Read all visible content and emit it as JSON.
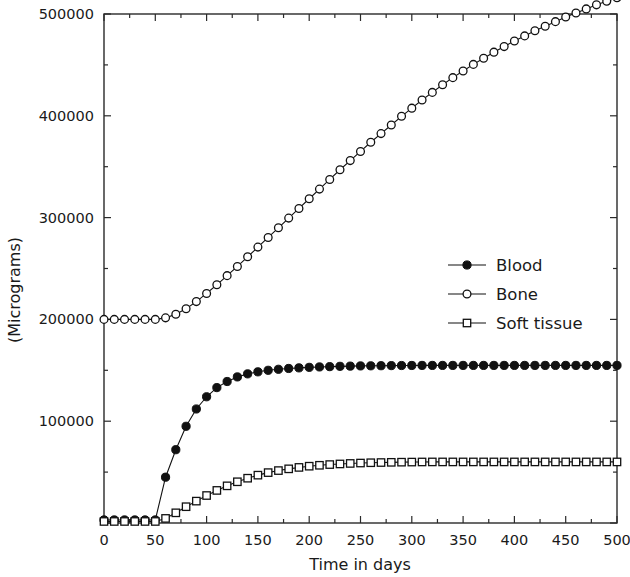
{
  "chart_data": {
    "type": "line",
    "title": "",
    "xlabel": "Time in days",
    "ylabel": "(Micrograms)",
    "xlim": [
      0,
      500
    ],
    "ylim": [
      0,
      500000
    ],
    "xticks": [
      0,
      50,
      100,
      150,
      200,
      250,
      300,
      350,
      400,
      450,
      500
    ],
    "xticklabels": [
      "0",
      "50",
      "100",
      "150",
      "200",
      "250",
      "300",
      "350",
      "400",
      "450",
      "500"
    ],
    "yticks": [
      0,
      100000,
      200000,
      300000,
      400000,
      500000
    ],
    "yticklabels": [
      "0",
      "100000",
      "200000",
      "300000",
      "400000",
      "500000"
    ],
    "x_minor_tick_interval": 25,
    "y_minor_tick_interval": 50000,
    "grid": false,
    "frame": "box",
    "legend_position": "center-right",
    "series": [
      {
        "name": "Blood",
        "marker": "filled-circle",
        "color": "#111111",
        "x": [
          0,
          10,
          20,
          30,
          40,
          50,
          60,
          70,
          80,
          90,
          100,
          110,
          120,
          130,
          140,
          150,
          160,
          170,
          180,
          190,
          200,
          210,
          220,
          230,
          240,
          250,
          260,
          270,
          280,
          290,
          300,
          310,
          320,
          330,
          340,
          350,
          360,
          370,
          380,
          390,
          400,
          410,
          420,
          430,
          440,
          450,
          460,
          470,
          480,
          490,
          500
        ],
        "values": [
          3000,
          3000,
          3000,
          3000,
          3000,
          3000,
          45000,
          72000,
          95000,
          112000,
          124000,
          133000,
          139000,
          143500,
          146500,
          148500,
          150000,
          151000,
          151800,
          152400,
          152900,
          153300,
          153600,
          153900,
          154100,
          154300,
          154400,
          154500,
          154600,
          154700,
          154750,
          154800,
          154800,
          154800,
          154800,
          154800,
          154800,
          154800,
          154800,
          154800,
          154800,
          154800,
          154800,
          154800,
          154800,
          154800,
          154800,
          154800,
          154800,
          154800,
          154800
        ]
      },
      {
        "name": "Bone",
        "marker": "open-circle",
        "color": "#111111",
        "x": [
          0,
          10,
          20,
          30,
          40,
          50,
          60,
          70,
          80,
          90,
          100,
          110,
          120,
          130,
          140,
          150,
          160,
          170,
          180,
          190,
          200,
          210,
          220,
          230,
          240,
          250,
          260,
          270,
          280,
          290,
          300,
          310,
          320,
          330,
          340,
          350,
          360,
          370,
          380,
          390,
          400,
          410,
          420,
          430,
          440,
          450,
          460,
          470,
          480,
          490,
          500
        ],
        "values": [
          200000,
          200000,
          200000,
          200000,
          200000,
          200000,
          201500,
          205000,
          210500,
          217500,
          225500,
          234000,
          243000,
          252000,
          261500,
          271000,
          280500,
          290000,
          299500,
          309000,
          318500,
          328000,
          337500,
          347000,
          356000,
          365000,
          374000,
          382500,
          391000,
          399500,
          407500,
          415500,
          423000,
          430500,
          437500,
          444000,
          450500,
          456500,
          462500,
          468000,
          473500,
          478500,
          483500,
          488000,
          492500,
          497000,
          501000,
          505000,
          509000,
          512500,
          516000
        ]
      },
      {
        "name": "Soft tissue",
        "marker": "open-square",
        "color": "#111111",
        "x": [
          0,
          10,
          20,
          30,
          40,
          50,
          60,
          70,
          80,
          90,
          100,
          110,
          120,
          130,
          140,
          150,
          160,
          170,
          180,
          190,
          200,
          210,
          220,
          230,
          240,
          250,
          260,
          270,
          280,
          290,
          300,
          310,
          320,
          330,
          340,
          350,
          360,
          370,
          380,
          390,
          400,
          410,
          420,
          430,
          440,
          450,
          460,
          470,
          480,
          490,
          500
        ],
        "values": [
          1500,
          1500,
          1500,
          1500,
          1500,
          1500,
          4500,
          10000,
          16000,
          21500,
          27000,
          32000,
          36500,
          40500,
          44000,
          47000,
          49500,
          51500,
          53200,
          54600,
          55800,
          56700,
          57400,
          58000,
          58500,
          58900,
          59200,
          59400,
          59600,
          59750,
          59850,
          59950,
          60000,
          60000,
          60000,
          60000,
          60000,
          60000,
          60000,
          60000,
          60000,
          60000,
          60000,
          60000,
          60000,
          60000,
          60000,
          60000,
          60000,
          60000,
          60000
        ]
      }
    ],
    "legend_entries": [
      "Blood",
      "Bone",
      "Soft tissue"
    ]
  }
}
